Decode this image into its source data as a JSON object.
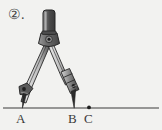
{
  "figure": {
    "item_number": "②.",
    "caption_style": "circled-numeral-with-period",
    "background_color": "#f2f2f0",
    "ink_color": "#2b2b2b",
    "metal_light": "#d9d9d9",
    "metal_mid": "#9a9a9a",
    "metal_dark": "#4a4a4a",
    "handle_color": "#555555",
    "tool": {
      "name": "drawing-compass",
      "parts": [
        "handle",
        "hinge",
        "left-leg",
        "right-leg",
        "needle-point",
        "pencil-holder",
        "pencil-lead"
      ]
    },
    "baseline": {
      "y": 108,
      "x_start": 3,
      "x_end": 159,
      "color": "#3a3a3a"
    },
    "points": [
      {
        "label": "A",
        "x": 22,
        "y": 108,
        "marker": "needle-tip"
      },
      {
        "label": "B",
        "x": 74,
        "y": 108,
        "marker": "pencil-tip"
      },
      {
        "label": "C",
        "x": 89,
        "y": 108,
        "marker": "dot"
      }
    ]
  }
}
